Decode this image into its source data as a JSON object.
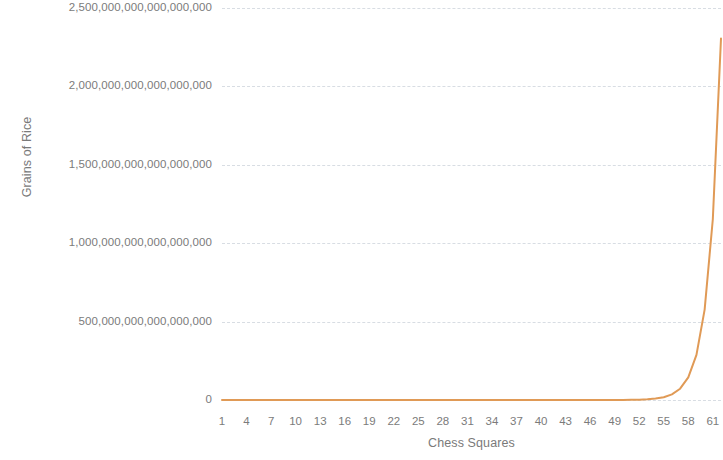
{
  "chart_data": {
    "type": "line",
    "title": "",
    "subtitle": "",
    "xlabel": "Chess Squares",
    "ylabel": "Grains of Rice",
    "grid": true,
    "grid_axis": "y",
    "legend": false,
    "legend_position": "none",
    "xlim": [
      1,
      62
    ],
    "ylim": [
      0,
      2500000000000000000
    ],
    "y_tick_labels": [
      "2,500,000,000,000,000,000",
      "2,000,000,000,000,000,000",
      "1,500,000,000,000,000,000",
      "1,000,000,000,000,000,000",
      "500,000,000,000,000,000",
      "0"
    ],
    "y_tick_values": [
      2500000000000000000,
      2000000000000000000,
      1500000000000000000,
      1000000000000000000,
      500000000000000000,
      0
    ],
    "x_tick_labels": [
      "1",
      "4",
      "7",
      "10",
      "13",
      "16",
      "19",
      "22",
      "25",
      "28",
      "31",
      "34",
      "37",
      "40",
      "43",
      "46",
      "49",
      "52",
      "55",
      "58",
      "61"
    ],
    "x_tick_values": [
      1,
      4,
      7,
      10,
      13,
      16,
      19,
      22,
      25,
      28,
      31,
      34,
      37,
      40,
      43,
      46,
      49,
      52,
      55,
      58,
      61
    ],
    "series": [
      {
        "name": "Grains of Rice",
        "color": "#E09A56",
        "line_width": 2,
        "markers": false,
        "x": [
          1,
          2,
          3,
          4,
          5,
          6,
          7,
          8,
          9,
          10,
          11,
          12,
          13,
          14,
          15,
          16,
          17,
          18,
          19,
          20,
          21,
          22,
          23,
          24,
          25,
          26,
          27,
          28,
          29,
          30,
          31,
          32,
          33,
          34,
          35,
          36,
          37,
          38,
          39,
          40,
          41,
          42,
          43,
          44,
          45,
          46,
          47,
          48,
          49,
          50,
          51,
          52,
          53,
          54,
          55,
          56,
          57,
          58,
          59,
          60,
          61,
          62
        ],
        "values": [
          1,
          2,
          4,
          8,
          16,
          32,
          64,
          128,
          256,
          512,
          1024,
          2048,
          4096,
          8192,
          16384,
          32768,
          65536,
          131072,
          262144,
          524288,
          1048576,
          2097152,
          4194304,
          8388608,
          16777216,
          33554432,
          67108864,
          134217728,
          268435456,
          536870912,
          1073741824,
          2147483648,
          4294967296,
          8589934592,
          17179869184,
          34359738368,
          68719476736,
          137438953472,
          274877906944,
          549755813888,
          1099511627776,
          2199023255552,
          4398046511104,
          8796093022208,
          17592186044416,
          35184372088832,
          70368744177664,
          140737488355328,
          281474976710656,
          562949953421312,
          1125899906842624,
          2251799813685248,
          4503599627370496,
          9007199254740992,
          18014398509481984,
          36028797018963968,
          72057594037927936,
          144115188075855872,
          288230376151711744,
          576460752303423488,
          1152921504606846976,
          2305843009213693952
        ]
      }
    ],
    "annotations": []
  }
}
